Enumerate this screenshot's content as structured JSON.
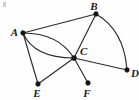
{
  "figure": {
    "kind": "undirected-multigraph-diagram",
    "width": 139,
    "height": 100,
    "background_color": "#fefefe",
    "edge_color": "#2b2b2b",
    "vertex_color": "#151515",
    "label_color": "#1a1a1a"
  },
  "vertices": [
    {
      "id": "A",
      "label": "A",
      "x": 23,
      "y": 33,
      "label_x": 14,
      "label_y": 32,
      "label_anchor": "end"
    },
    {
      "id": "B",
      "label": "B",
      "x": 96,
      "y": 14,
      "label_x": 93,
      "label_y": 6,
      "label_anchor": "middle"
    },
    {
      "id": "C",
      "label": "C",
      "x": 74,
      "y": 58,
      "label_x": 80,
      "label_y": 52,
      "label_anchor": "start"
    },
    {
      "id": "D",
      "label": "D",
      "x": 127,
      "y": 70,
      "label_x": 132,
      "label_y": 73,
      "label_anchor": "start"
    },
    {
      "id": "E",
      "label": "E",
      "x": 38,
      "y": 84,
      "label_x": 37,
      "label_y": 95,
      "label_anchor": "middle"
    },
    {
      "id": "F",
      "label": "F",
      "x": 88,
      "y": 83,
      "label_x": 87,
      "label_y": 95,
      "label_anchor": "middle"
    }
  ],
  "edges": [
    {
      "id": "A-B",
      "from": "A",
      "to": "B",
      "shape": "straight",
      "path": "M 23 33 L 96 14"
    },
    {
      "id": "A-C-upper",
      "from": "A",
      "to": "C",
      "shape": "curved",
      "path": "M 23 33 Q 58 33 74 58"
    },
    {
      "id": "A-C-lower",
      "from": "A",
      "to": "C",
      "shape": "curved",
      "path": "M 23 33 Q 34 58 74 58"
    },
    {
      "id": "A-E",
      "from": "A",
      "to": "E",
      "shape": "straight",
      "path": "M 23 33 L 38 84"
    },
    {
      "id": "B-C",
      "from": "B",
      "to": "C",
      "shape": "straight",
      "path": "M 96 14 L 74 58"
    },
    {
      "id": "B-D",
      "from": "B",
      "to": "D",
      "shape": "curved",
      "path": "M 96 14 Q 124 30 127 70"
    },
    {
      "id": "C-D",
      "from": "C",
      "to": "D",
      "shape": "straight",
      "path": "M 74 58 L 127 70"
    },
    {
      "id": "C-E",
      "from": "C",
      "to": "E",
      "shape": "straight",
      "path": "M 74 58 L 38 84"
    },
    {
      "id": "C-F",
      "from": "C",
      "to": "F",
      "shape": "straight",
      "path": "M 74 58 L 88 83"
    }
  ],
  "vertex_radius": 2.4
}
